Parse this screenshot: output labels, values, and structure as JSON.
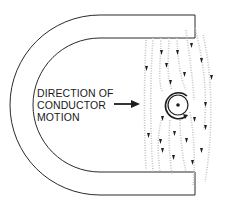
{
  "diagram": {
    "label_lines": [
      "DIRECTION OF",
      "CONDUCTOR",
      "MOTION"
    ],
    "elements": {
      "magnet": "horseshoe-magnet",
      "conductor": "conductor-cross-section-dot",
      "field_lines": "magnetic-flux-lines-downward",
      "motion_arrow": "arrow-right"
    },
    "colors": {
      "stroke": "#2a2a2a",
      "field": "#b8b8b8",
      "background": "#ffffff"
    }
  }
}
